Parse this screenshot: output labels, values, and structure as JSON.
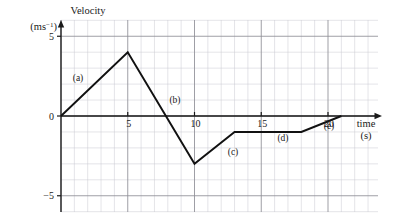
{
  "figure": {
    "background": "#ffffff",
    "ink_color": "#1a1a1a",
    "grid_major_color": "#8e8e96",
    "grid_minor_color": "#c9c9d0",
    "curve_color": "#111111"
  },
  "axes": {
    "y_title_line1": "Velocity",
    "y_title_line2_base": "(ms",
    "y_title_line2_sup": "−1",
    "y_title_line2_close": ")",
    "x_title_line1": "time",
    "x_title_line2": "(s)",
    "y_ticks": [
      {
        "label": "5",
        "value": 5
      },
      {
        "label": "0",
        "value": 0
      },
      {
        "label": "−5",
        "value": -5
      }
    ],
    "x_ticks": [
      {
        "label": "5",
        "value": 5
      },
      {
        "label": "10",
        "value": 10
      },
      {
        "label": "15",
        "value": 15
      },
      {
        "label": "20",
        "value": 20
      }
    ],
    "x_range": [
      0,
      24
    ],
    "y_range": [
      -7,
      6
    ],
    "grid": "on",
    "grid_minor_step_x": 1,
    "grid_minor_step_y": 1,
    "grid_major_step_x": 5,
    "grid_major_step_y": 5
  },
  "segment_labels": [
    {
      "id": "a",
      "text": "(a)",
      "x_px": 78,
      "y_px": 81
    },
    {
      "id": "b",
      "text": "(b)",
      "x_px": 175,
      "y_px": 103
    },
    {
      "id": "c",
      "text": "(c)",
      "x_px": 233,
      "y_px": 155
    },
    {
      "id": "d",
      "text": "(d)",
      "x_px": 283,
      "y_px": 141
    },
    {
      "id": "e",
      "text": "(e)",
      "x_px": 329,
      "y_px": 129
    }
  ],
  "chart_data": {
    "type": "line",
    "title": "",
    "xlabel": "time (s)",
    "ylabel": "Velocity (ms⁻¹)",
    "xlim": [
      0,
      24
    ],
    "ylim": [
      -7,
      6
    ],
    "grid": "on",
    "legend": "none",
    "series": [
      {
        "name": "velocity",
        "x": [
          0,
          5,
          10,
          13,
          18,
          21
        ],
        "y": [
          0,
          4,
          -3,
          -1,
          -1,
          0
        ],
        "annotations": [
          "(a)",
          "(b)",
          "(c)",
          "(d)",
          "(e)"
        ]
      }
    ],
    "points": [
      {
        "t": 0,
        "v": 0,
        "note": "start of (a)"
      },
      {
        "t": 5,
        "v": 4,
        "note": "peak, end of (a) / start of (b)"
      },
      {
        "t": 10,
        "v": -3,
        "note": "minimum, end of (b) / start of (c)"
      },
      {
        "t": 13,
        "v": -1,
        "note": "end of (c) / start of (d)"
      },
      {
        "t": 18,
        "v": -1,
        "note": "end of (d) / start of (e)"
      },
      {
        "t": 21,
        "v": 0,
        "note": "end of (e), returns to zero"
      }
    ]
  }
}
